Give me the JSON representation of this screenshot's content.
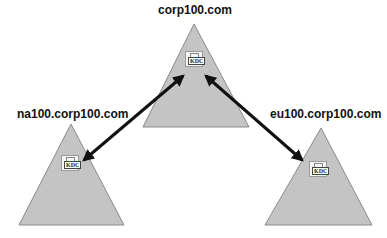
{
  "domains": {
    "root": {
      "label": "corp100.com",
      "service": "KDC"
    },
    "left": {
      "label": "na100.corp100.com",
      "service": "KDC"
    },
    "right": {
      "label": "eu100.corp100.com",
      "service": "KDC"
    }
  },
  "colors": {
    "triangle_fill": "#c4c4c4",
    "triangle_stroke": "#8a8a8a",
    "arrow": "#111111"
  },
  "relationships": [
    {
      "from": "na100.corp100.com",
      "to": "corp100.com",
      "type": "two-way trust"
    },
    {
      "from": "eu100.corp100.com",
      "to": "corp100.com",
      "type": "two-way trust"
    }
  ]
}
